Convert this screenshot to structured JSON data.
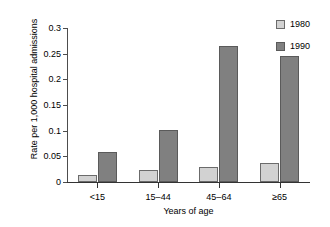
{
  "chart_data": {
    "type": "bar",
    "title": "",
    "xlabel": "Years of age",
    "ylabel": "Rate per 1,000 hospital admissions",
    "categories": [
      "<15",
      "15–44",
      "45–64",
      "≥65"
    ],
    "series": [
      {
        "name": "1980",
        "values": [
          0.013,
          0.023,
          0.03,
          0.037
        ],
        "color": "#d2d2d2"
      },
      {
        "name": "1990",
        "values": [
          0.058,
          0.101,
          0.264,
          0.245
        ],
        "color": "#808080"
      }
    ],
    "ylim": [
      0,
      0.3
    ],
    "ytick_labels": [
      "0",
      "0.05",
      "0.1",
      "0.15",
      "0.2",
      "0.25",
      "0.3"
    ],
    "ytick_values": [
      0,
      0.05,
      0.1,
      0.15,
      0.2,
      0.25,
      0.3
    ],
    "grid": false,
    "legend_position": "right-top",
    "legend_entries": [
      "1980",
      "1990"
    ]
  }
}
